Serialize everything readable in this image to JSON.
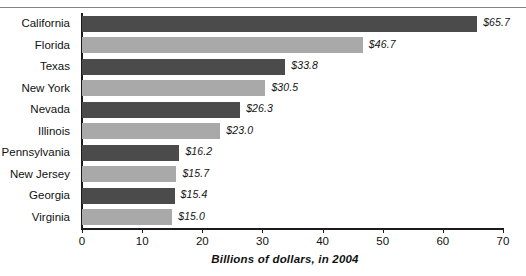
{
  "chart_data": {
    "type": "bar",
    "orientation": "horizontal",
    "title": "",
    "xlabel": "Billions of dollars, in 2004",
    "ylabel": "",
    "categories": [
      "California",
      "Florida",
      "Texas",
      "New York",
      "Nevada",
      "Illinois",
      "Pennsylvania",
      "New Jersey",
      "Georgia",
      "Virginia"
    ],
    "values": [
      65.7,
      46.7,
      33.8,
      30.5,
      26.3,
      23.0,
      16.2,
      15.7,
      15.4,
      15.0
    ],
    "value_labels": [
      "$65.7",
      "$46.7",
      "$33.8",
      "$30.5",
      "$26.3",
      "$23.0",
      "$16.2",
      "$15.7",
      "$15.4",
      "$15.0"
    ],
    "bar_colors": [
      "#4b4b4b",
      "#a9a9a9",
      "#4b4b4b",
      "#a9a9a9",
      "#4b4b4b",
      "#a9a9a9",
      "#4b4b4b",
      "#a9a9a9",
      "#4b4b4b",
      "#a9a9a9"
    ],
    "xlim": [
      0,
      70
    ],
    "xticks": [
      0,
      10,
      20,
      30,
      40,
      50,
      60,
      70
    ],
    "xtick_labels": [
      "0",
      "10",
      "20",
      "30",
      "40",
      "50",
      "60",
      "70"
    ],
    "grid": false,
    "legend": null,
    "colors": {
      "dark_bar": "#4b4b4b",
      "light_bar": "#a9a9a9",
      "axis": "#1b1b1b",
      "text": "#111111",
      "background": "#ffffff"
    }
  }
}
